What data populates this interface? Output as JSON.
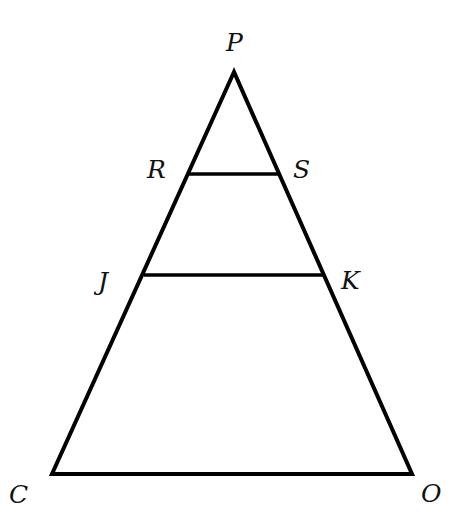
{
  "diagram": {
    "type": "geometry",
    "colors": {
      "background": "#ffffff",
      "stroke": "#000000",
      "label": "#111111"
    },
    "points": {
      "P": {
        "label": "P",
        "x": 234,
        "y": 72,
        "label_x": 226,
        "label_y": 51
      },
      "R": {
        "label": "R",
        "x": 189,
        "y": 174,
        "label_x": 147,
        "label_y": 178
      },
      "S": {
        "label": "S",
        "x": 279,
        "y": 174,
        "label_x": 293,
        "label_y": 178
      },
      "J": {
        "label": "J",
        "x": 144,
        "y": 275,
        "label_x": 98,
        "label_y": 290
      },
      "K": {
        "label": "K",
        "x": 323,
        "y": 275,
        "label_x": 341,
        "label_y": 289
      },
      "C": {
        "label": "C",
        "x": 52,
        "y": 474,
        "label_x": 9,
        "label_y": 503
      },
      "O": {
        "label": "O",
        "x": 412,
        "y": 474,
        "label_x": 421,
        "label_y": 502
      }
    },
    "segments": [
      {
        "name": "PC",
        "from": "P",
        "to": "C"
      },
      {
        "name": "PO",
        "from": "P",
        "to": "O"
      },
      {
        "name": "CO",
        "from": "C",
        "to": "O"
      },
      {
        "name": "RS",
        "from": "R",
        "to": "S"
      },
      {
        "name": "JK",
        "from": "J",
        "to": "K"
      }
    ]
  }
}
